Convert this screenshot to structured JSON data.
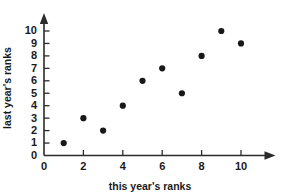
{
  "chart_data": {
    "type": "scatter",
    "title": "",
    "xlabel": "this year's ranks",
    "ylabel": "last year's ranks",
    "xlim": [
      0,
      11.6
    ],
    "ylim": [
      0,
      11.2
    ],
    "grid": false,
    "legend": null,
    "x_ticks": [
      0,
      2,
      4,
      6,
      8,
      10
    ],
    "x_tick_labels": [
      "0",
      "2",
      "4",
      "6",
      "8",
      "10"
    ],
    "x_minor_ticks": [
      1,
      3,
      5,
      7,
      9
    ],
    "y_ticks": [
      0,
      1,
      2,
      3,
      4,
      5,
      6,
      7,
      8,
      9,
      10
    ],
    "y_tick_labels": [
      "0",
      "1",
      "2",
      "3",
      "4",
      "5",
      "6",
      "7",
      "8",
      "9",
      "10"
    ],
    "series": [
      {
        "name": "rank pairs",
        "marker": "filled-circle",
        "color": "#181818",
        "points": [
          {
            "x": 1,
            "y": 1
          },
          {
            "x": 2,
            "y": 3
          },
          {
            "x": 3,
            "y": 2
          },
          {
            "x": 4,
            "y": 4
          },
          {
            "x": 5,
            "y": 6
          },
          {
            "x": 6,
            "y": 7
          },
          {
            "x": 7,
            "y": 5
          },
          {
            "x": 8,
            "y": 8
          },
          {
            "x": 9,
            "y": 10
          },
          {
            "x": 10,
            "y": 9
          }
        ]
      }
    ],
    "axis_style": {
      "x_axis_arrow": true,
      "y_axis_arrow": true,
      "axis_color": "#2b2b2b"
    }
  }
}
